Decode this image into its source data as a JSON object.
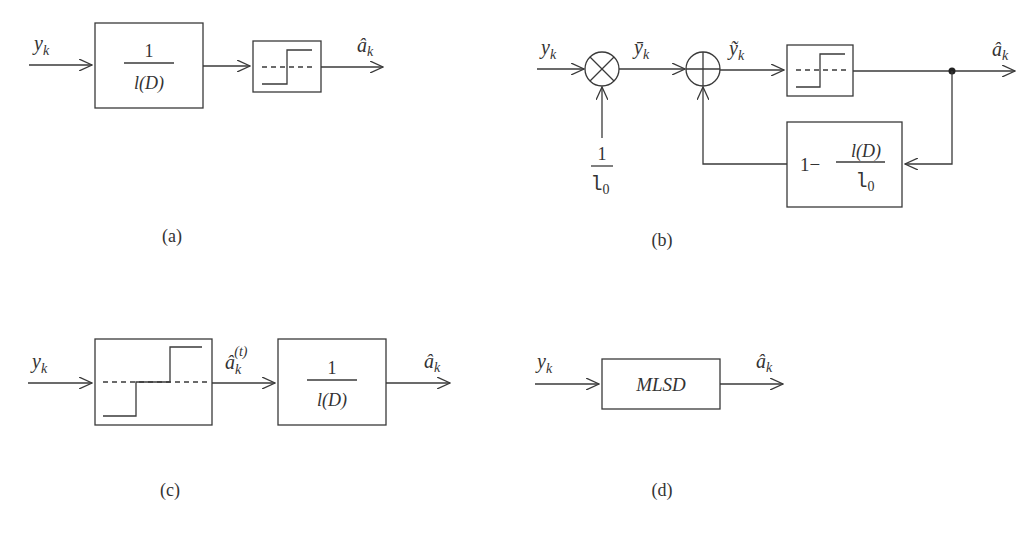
{
  "figure": {
    "a": {
      "caption": "(a)",
      "input_label": "y",
      "input_sub": "k",
      "filter_num": "1",
      "filter_den": "l(D)",
      "output_label": "â",
      "output_sub": "k"
    },
    "b": {
      "caption": "(b)",
      "input_label": "y",
      "input_sub": "k",
      "scaled_label": "ȳ",
      "scaled_sub": "k",
      "sum_label": "ỹ",
      "sum_sub": "k",
      "gain_num": "1",
      "gain_den": "l",
      "gain_den_sub": "0",
      "feedback_prefix": "1−",
      "feedback_num": "l(D)",
      "feedback_den": "l",
      "feedback_den_sub": "0",
      "output_label": "â",
      "output_sub": "k"
    },
    "c": {
      "caption": "(c)",
      "input_label": "y",
      "input_sub": "k",
      "mid_label": "â",
      "mid_sub": "k",
      "mid_sup": "(t)",
      "filter_num": "1",
      "filter_den": "l(D)",
      "output_label": "â",
      "output_sub": "k"
    },
    "d": {
      "caption": "(d)",
      "input_label": "y",
      "input_sub": "k",
      "block_label": "MLSD",
      "output_label": "â",
      "output_sub": "k"
    }
  }
}
